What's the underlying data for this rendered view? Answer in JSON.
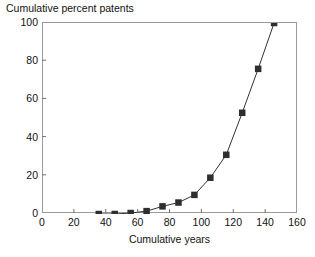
{
  "chart_data": {
    "type": "line",
    "title": "Cumulative percent patents",
    "xlabel": "Cumulative years",
    "ylabel": "",
    "xlim": [
      0,
      160
    ],
    "ylim": [
      0,
      100
    ],
    "xticks": [
      0,
      20,
      40,
      60,
      80,
      100,
      120,
      140,
      160
    ],
    "yticks": [
      0,
      20,
      40,
      60,
      80,
      100
    ],
    "grid": false,
    "legend": null,
    "marker": "filled-square",
    "series": [
      {
        "name": "Cumulative percent patents",
        "color": "#333333",
        "x": [
          35,
          45,
          55,
          65,
          75,
          85,
          95,
          105,
          115,
          125,
          135,
          145
        ],
        "values": [
          0,
          0,
          0.5,
          1.5,
          4,
          6,
          10,
          19,
          31,
          53,
          76,
          100
        ]
      }
    ]
  },
  "axes": {
    "x_title": "Cumulative years",
    "y_title": "Cumulative percent patents",
    "x_tick_labels": [
      "0",
      "20",
      "40",
      "60",
      "80",
      "100",
      "120",
      "140",
      "160"
    ],
    "y_tick_labels": [
      "0",
      "20",
      "40",
      "60",
      "80",
      "100"
    ]
  },
  "colors": {
    "line": "#333333",
    "marker": "#2e2e2e",
    "frame": "#9a9a9a",
    "text": "#111111",
    "background": "#ffffff"
  }
}
